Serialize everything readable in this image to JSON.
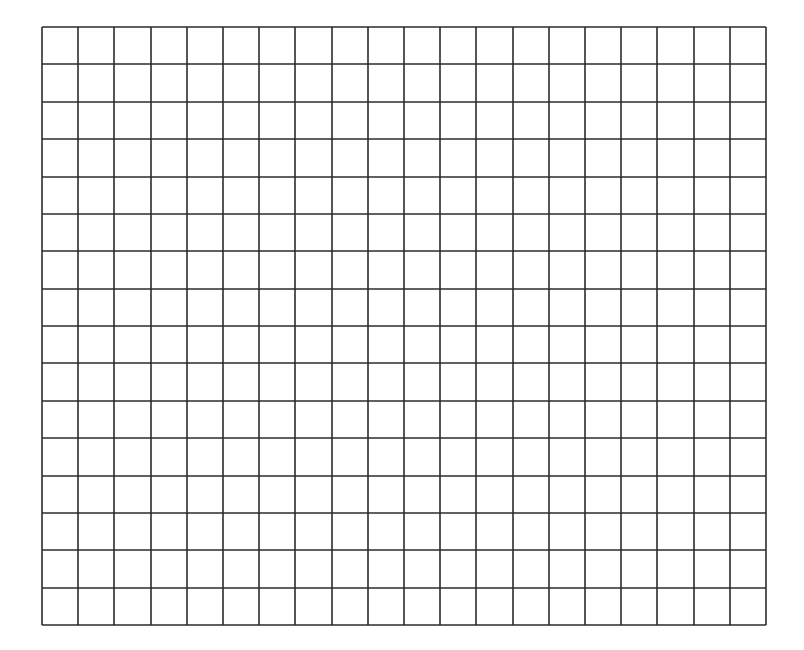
{
  "grid": {
    "columns": 20,
    "rows": 16,
    "left": 41,
    "top": 26,
    "width": 724,
    "height": 598,
    "line_color": "#2b2b2b",
    "line_width": 1.6,
    "background": "#ffffff"
  }
}
